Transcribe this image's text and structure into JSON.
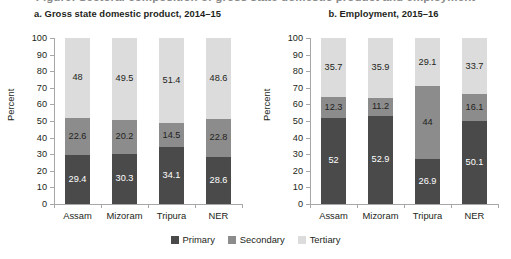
{
  "figure": {
    "title_remnant": "Figure: Sectoral composition of gross state domestic product and employment",
    "background": "#ffffff"
  },
  "series_colors": {
    "primary": "#4a4a4a",
    "secondary": "#8c8c8c",
    "tertiary": "#dcdcdc"
  },
  "legend": {
    "items": [
      {
        "label": "Primary",
        "color": "#4a4a4a"
      },
      {
        "label": "Secondary",
        "color": "#8c8c8c"
      },
      {
        "label": "Tertiary",
        "color": "#dcdcdc"
      }
    ]
  },
  "axis": {
    "ylabel": "Percent",
    "yticks": [
      "0",
      "10",
      "20",
      "30",
      "40",
      "50",
      "60",
      "70",
      "80",
      "90",
      "100"
    ]
  },
  "chart_data": [
    {
      "type": "bar",
      "stacked": true,
      "panel": "a",
      "title": "a. Gross state domestic product, 2014–15",
      "categories": [
        "Assam",
        "Mizoram",
        "Tripura",
        "NER"
      ],
      "series": [
        {
          "name": "Primary",
          "values": [
            29.4,
            30.3,
            34.1,
            28.6
          ],
          "labels": [
            "29.4",
            "30.3",
            "34.1",
            "28.6"
          ]
        },
        {
          "name": "Secondary",
          "values": [
            22.6,
            20.2,
            14.5,
            22.8
          ],
          "labels": [
            "22.6",
            "20.2",
            "14.5",
            "22.8"
          ]
        },
        {
          "name": "Tertiary",
          "values": [
            48.0,
            49.5,
            51.4,
            48.6
          ],
          "labels": [
            "48",
            "49.5",
            "51.4",
            "48.6"
          ]
        }
      ],
      "xlabel": "",
      "ylabel": "Percent",
      "ylim": [
        0,
        100
      ],
      "ytick_step": 10,
      "grid": false,
      "legend_position": "bottom-center-shared"
    },
    {
      "type": "bar",
      "stacked": true,
      "panel": "b",
      "title": "b. Employment, 2015–16",
      "categories": [
        "Assam",
        "Mizoram",
        "Tripura",
        "NER"
      ],
      "series": [
        {
          "name": "Primary",
          "values": [
            52.0,
            52.9,
            26.9,
            50.1
          ],
          "labels": [
            "52",
            "52.9",
            "26.9",
            "50.1"
          ]
        },
        {
          "name": "Secondary",
          "values": [
            12.3,
            11.2,
            44.0,
            16.1
          ],
          "labels": [
            "12.3",
            "11.2",
            "44",
            "16.1"
          ]
        },
        {
          "name": "Tertiary",
          "values": [
            35.7,
            35.9,
            29.1,
            33.7
          ],
          "labels": [
            "35.7",
            "35.9",
            "29.1",
            "33.7"
          ]
        }
      ],
      "xlabel": "",
      "ylabel": "Percent",
      "ylim": [
        0,
        100
      ],
      "ytick_step": 10,
      "grid": false,
      "legend_position": "bottom-center-shared"
    }
  ]
}
